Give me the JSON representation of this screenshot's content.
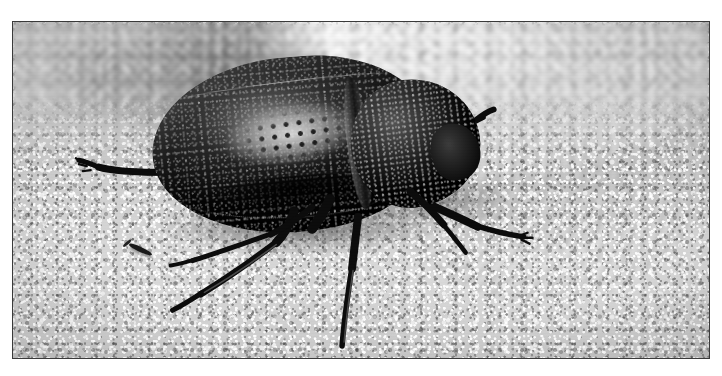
{
  "image": {
    "kind": "photograph",
    "subject": "darkling beetle on sand",
    "color_mode": "black and white",
    "orientation": "landscape",
    "caption": "Black and white close-up photograph of a large dark beetle standing on coarse sand, with a blurred pale shell-like object in the background.",
    "frame": {
      "border_color": "#3a3a3a",
      "matte_color": "#ffffff",
      "photo_left": 12,
      "photo_top": 21,
      "photo_width": 698,
      "photo_height": 338
    },
    "palette": {
      "sand_light": "#d2d2d2",
      "sand_mid": "#c2c2c2",
      "sand_dark": "#8e8e8e",
      "beetle_body": "#141414",
      "beetle_highlight": "#b4b4b4",
      "background_highlight": "#f7f7f7",
      "background_shadow": "#606060"
    },
    "elements": {
      "beetle_body_label": "beetle body",
      "elytra_label": "elytra (wing covers)",
      "elytra_patch_label": "pale worn patch with pitted rows",
      "pronotum_label": "pronotum",
      "head_label": "head",
      "antenna_label": "antenna",
      "legs_label": "legs",
      "sand_label": "sand substrate",
      "background_object_label": "blurred shell in background",
      "shadow_label": "cast shadow",
      "debris_label": "sand debris twig"
    }
  }
}
